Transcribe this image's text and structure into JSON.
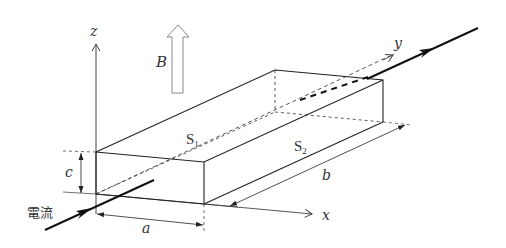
{
  "diagram": {
    "labels": {
      "z_axis": "z",
      "x_axis": "x",
      "y_axis": "y",
      "magnetic_field": "B",
      "height": "c",
      "width": "a",
      "length": "b",
      "surface_top": "S",
      "surface_top_sub": "1",
      "surface_side": "S",
      "surface_side_sub": "2",
      "current": "電流"
    },
    "colors": {
      "line": "#222222",
      "axis": "#444444",
      "field_arrow": "#888888"
    }
  }
}
